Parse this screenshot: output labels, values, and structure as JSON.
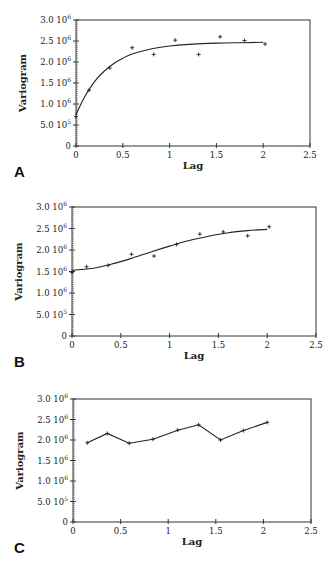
{
  "figure": {
    "panels": [
      {
        "letter": "A",
        "ylabel": "Variogram",
        "xlabel": "Lag",
        "box": {
          "x0": 76,
          "x1": 310,
          "ytop": 20,
          "ybottom": 146
        },
        "yticks": [
          {
            "mant": "0",
            "exp": ""
          },
          {
            "mant": "5.0 10",
            "exp": "5"
          },
          {
            "mant": "1.0 10",
            "exp": "6"
          },
          {
            "mant": "1.5 10",
            "exp": "6"
          },
          {
            "mant": "2.0 10",
            "exp": "6"
          },
          {
            "mant": "2.5 10",
            "exp": "6"
          },
          {
            "mant": "3.0 10",
            "exp": "6"
          }
        ],
        "xticks": [
          "0",
          "0.5",
          "1",
          "1.5",
          "2",
          "2.5"
        ]
      },
      {
        "letter": "B",
        "ylabel": "Variogram",
        "xlabel": "Lag",
        "box": {
          "x0": 72,
          "x1": 316,
          "ytop": 17,
          "ybottom": 146
        },
        "yticks": [
          {
            "mant": "0",
            "exp": ""
          },
          {
            "mant": "5.0 10",
            "exp": "5"
          },
          {
            "mant": "1.0 10",
            "exp": "6"
          },
          {
            "mant": "1.5 10",
            "exp": "6"
          },
          {
            "mant": "2.0 10",
            "exp": "6"
          },
          {
            "mant": "2.5 10",
            "exp": "6"
          },
          {
            "mant": "3.0 10",
            "exp": "6"
          }
        ],
        "xticks": [
          "0",
          "0.5",
          "1",
          "1.5",
          "2",
          "2.5"
        ]
      },
      {
        "letter": "C",
        "ylabel": "Variogram",
        "xlabel": "Lag",
        "box": {
          "x0": 73,
          "x1": 311,
          "ytop": 24,
          "ybottom": 147
        },
        "yticks": [
          {
            "mant": "0",
            "exp": ""
          },
          {
            "mant": "5.0 10",
            "exp": "5"
          },
          {
            "mant": "1.0 10",
            "exp": "6"
          },
          {
            "mant": "1.5 10",
            "exp": "6"
          },
          {
            "mant": "2.0 10",
            "exp": "6"
          },
          {
            "mant": "2.5 10",
            "exp": "6"
          },
          {
            "mant": "3.0 10",
            "exp": "6"
          }
        ],
        "xticks": [
          "0",
          "0.5",
          "1",
          "1.5",
          "2",
          "2.5"
        ]
      }
    ]
  },
  "chart_data": [
    {
      "panel": "A",
      "type": "scatter",
      "title": "",
      "xlabel": "Lag",
      "ylabel": "Variogram",
      "xlim": [
        0,
        2.5
      ],
      "ylim": [
        0,
        3000000
      ],
      "grid": false,
      "series": [
        {
          "name": "experimental variogram",
          "style": "markers",
          "x": [
            0.0,
            0.14,
            0.36,
            0.6,
            0.83,
            1.06,
            1.31,
            1.54,
            1.8,
            2.02
          ],
          "y": [
            700000,
            1330000,
            1860000,
            2340000,
            2180000,
            2520000,
            2180000,
            2600000,
            2510000,
            2430000
          ]
        },
        {
          "name": "fitted model (exponential)",
          "style": "line",
          "x": [
            0.0,
            0.1,
            0.2,
            0.3,
            0.4,
            0.5,
            0.6,
            0.8,
            1.0,
            1.2,
            1.5,
            1.8,
            2.0
          ],
          "y": [
            750000,
            1200000,
            1540000,
            1780000,
            1960000,
            2090000,
            2190000,
            2310000,
            2380000,
            2420000,
            2450000,
            2460000,
            2470000
          ]
        }
      ]
    },
    {
      "panel": "B",
      "type": "scatter",
      "title": "",
      "xlabel": "Lag",
      "ylabel": "Variogram",
      "xlim": [
        0,
        2.5
      ],
      "ylim": [
        0,
        3000000
      ],
      "grid": false,
      "series": [
        {
          "name": "experimental variogram",
          "style": "markers",
          "x": [
            0.0,
            0.15,
            0.37,
            0.61,
            0.84,
            1.07,
            1.31,
            1.55,
            1.8,
            2.02
          ],
          "y": [
            1480000,
            1610000,
            1640000,
            1900000,
            1860000,
            2130000,
            2370000,
            2420000,
            2330000,
            2540000
          ]
        },
        {
          "name": "fitted model (gaussian)",
          "style": "line",
          "x": [
            0.0,
            0.2,
            0.4,
            0.6,
            0.8,
            1.0,
            1.2,
            1.4,
            1.6,
            1.8,
            2.0
          ],
          "y": [
            1530000,
            1570000,
            1670000,
            1800000,
            1950000,
            2090000,
            2220000,
            2320000,
            2400000,
            2450000,
            2480000
          ]
        }
      ]
    },
    {
      "panel": "C",
      "type": "line",
      "title": "",
      "xlabel": "Lag",
      "ylabel": "Variogram",
      "xlim": [
        0,
        2.5
      ],
      "ylim": [
        0,
        3000000
      ],
      "grid": false,
      "series": [
        {
          "name": "experimental variogram",
          "style": "line+markers",
          "x": [
            0.15,
            0.36,
            0.59,
            0.84,
            1.1,
            1.32,
            1.55,
            1.79,
            2.04
          ],
          "y": [
            1930000,
            2160000,
            1920000,
            2020000,
            2240000,
            2370000,
            2000000,
            2230000,
            2430000
          ]
        }
      ]
    }
  ]
}
